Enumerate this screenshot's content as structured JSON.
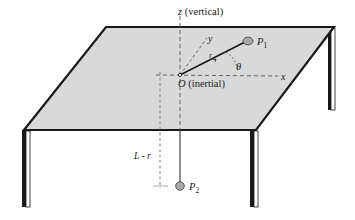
{
  "figure": {
    "colors": {
      "table_top": "#d9d9d9",
      "outline": "#1a1a1a",
      "leg_front": "#ffffff",
      "particle": "#a8a8a8",
      "dashed": "#555555"
    }
  },
  "labels": {
    "z_axis": "z",
    "z_axis_note": " (vertical)",
    "x_axis": "x",
    "y_axis": "y",
    "origin": "O",
    "origin_note": " (inertial)",
    "radius": "r",
    "angle": "θ",
    "particle_1": "P",
    "particle_1_sub": "1",
    "particle_2": "P",
    "particle_2_sub": "2",
    "hanging_length": "L - r"
  }
}
